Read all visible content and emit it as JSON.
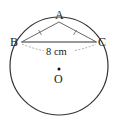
{
  "diagram": {
    "type": "circle-geometry",
    "points": {
      "A": "A",
      "B": "B",
      "C": "C",
      "O": "O"
    },
    "measurement_label": "8 cm",
    "measured_segment": "BC",
    "equal_segments": [
      "AB",
      "AC"
    ],
    "colors": {
      "stroke": "#333333",
      "dashed": "#888888",
      "text": "#222222"
    }
  }
}
